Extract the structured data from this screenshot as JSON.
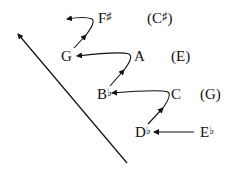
{
  "diagram": {
    "type": "voice-leading / pitch ascent diagram",
    "colors": {
      "ink": "#111111",
      "background": "#ffffff"
    },
    "notes": [
      {
        "id": "f-sharp",
        "letter": "F",
        "accidental": "♯",
        "x": 98,
        "y": 11
      },
      {
        "id": "c-sharp-paren",
        "letter": "(C",
        "accidental": "♯",
        "suffix": ")",
        "x": 147,
        "y": 11
      },
      {
        "id": "g",
        "letter": "G",
        "accidental": "",
        "x": 61,
        "y": 49
      },
      {
        "id": "a",
        "letter": "A",
        "accidental": "",
        "x": 134,
        "y": 49
      },
      {
        "id": "e-paren",
        "letter": "(E)",
        "accidental": "",
        "x": 171,
        "y": 49
      },
      {
        "id": "b-flat",
        "letter": "B",
        "accidental": "♭",
        "x": 97,
        "y": 87
      },
      {
        "id": "c",
        "letter": "C",
        "accidental": "",
        "x": 171,
        "y": 87
      },
      {
        "id": "g-paren",
        "letter": "(G)",
        "accidental": "",
        "x": 200,
        "y": 87
      },
      {
        "id": "d-flat",
        "letter": "D",
        "accidental": "♭",
        "x": 135,
        "y": 125
      },
      {
        "id": "e-flat",
        "letter": "E",
        "accidental": "♭",
        "x": 200,
        "y": 125
      }
    ],
    "arrows": [
      {
        "id": "long-diagonal",
        "from": [
          127,
          163
        ],
        "to": [
          17,
          33
        ],
        "description": "long diagonal arrow pointing up-left"
      },
      {
        "id": "eflat-to-dflat",
        "from": [
          193,
          133
        ],
        "to": [
          153,
          133
        ]
      },
      {
        "id": "dflat-to-c",
        "path": "curve up-right from D♭ to C then back left to B♭"
      },
      {
        "id": "bflat-to-a",
        "path": "curve up-right from B♭ to A then back left to G"
      },
      {
        "id": "g-to-fsharp",
        "path": "curve up-right from G to F♯ then back left"
      }
    ]
  }
}
